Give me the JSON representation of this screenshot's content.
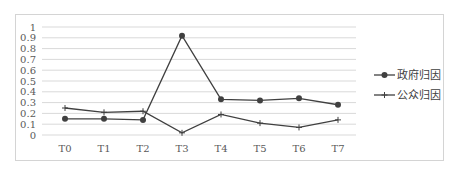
{
  "chart_data": {
    "type": "line",
    "title": "",
    "xlabel": "",
    "ylabel": "",
    "categories": [
      "T0",
      "T1",
      "T2",
      "T3",
      "T4",
      "T5",
      "T6",
      "T7"
    ],
    "series": [
      {
        "name": "政府归因",
        "marker": "circle",
        "color": "#404040",
        "values": [
          0.15,
          0.15,
          0.14,
          0.92,
          0.33,
          0.32,
          0.34,
          0.28
        ]
      },
      {
        "name": "公众归因",
        "marker": "plus",
        "color": "#404040",
        "values": [
          0.25,
          0.21,
          0.22,
          0.02,
          0.19,
          0.11,
          0.07,
          0.14
        ]
      }
    ],
    "ylim": [
      0,
      1
    ],
    "yticks": [
      "0",
      "0.1",
      "0.2",
      "0.3",
      "0.4",
      "0.5",
      "0.6",
      "0.7",
      "0.8",
      "0.9",
      "1"
    ],
    "grid": true,
    "legend_position": "right"
  },
  "colors": {
    "grid": "#d9d9d9",
    "line": "#404040",
    "border": "#d4d4d4",
    "text": "#595959"
  }
}
